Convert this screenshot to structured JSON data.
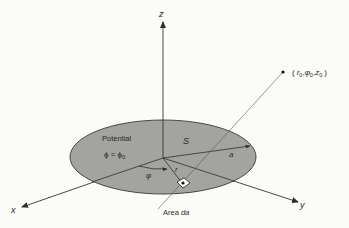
{
  "diagram": {
    "type": "3D coordinate geometry figure",
    "colors": {
      "background": "#fbfbf7",
      "disk_fill": "#a3a3a0",
      "disk_edge": "#3a3a3a",
      "lines": "#2e2e2e"
    },
    "axes": {
      "x_label": "x",
      "y_label": "y",
      "z_label": "z"
    },
    "disk": {
      "region_label": "S",
      "potential_title": "Potential",
      "potential_eq_lhs": "ϕ = ϕ",
      "potential_eq_sub": "0",
      "radius_label": "a"
    },
    "polar": {
      "angle_label": "φ",
      "radius_label": "r"
    },
    "area_element": {
      "label_prefix": "Area ",
      "label_var": "da"
    },
    "field_point": {
      "open_paren": "(",
      "r": "r",
      "r_sub": "0",
      "comma1": ",",
      "phi": "φ",
      "phi_sub": "0",
      "comma2": ",",
      "z": "z",
      "z_sub": "0",
      "close_paren": ")"
    }
  }
}
